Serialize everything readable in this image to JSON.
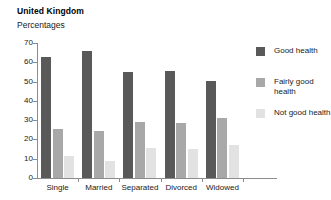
{
  "chart_data": {
    "type": "bar",
    "title": "United Kingdom",
    "subtitle": "Percentages",
    "xlabel": "",
    "ylabel": "",
    "ylim": [
      0,
      70
    ],
    "yticks": [
      0,
      10,
      20,
      30,
      40,
      50,
      60,
      70
    ],
    "grid": false,
    "legend_position": "right",
    "categories": [
      "Single",
      "Married",
      "Separated",
      "Divorced",
      "Widowed"
    ],
    "series": [
      {
        "name": "Good health",
        "color": "#595959",
        "values": [
          63,
          66,
          55,
          55.5,
          50.5
        ]
      },
      {
        "name": "Fairly good health",
        "color": "#a8a8a8",
        "values": [
          25.5,
          24.5,
          29,
          28.5,
          31
        ]
      },
      {
        "name": "Not good health",
        "color": "#e2e2e2",
        "values": [
          11.5,
          9,
          15.5,
          15,
          17
        ]
      }
    ]
  },
  "legend": {
    "items": [
      {
        "label": "Good health"
      },
      {
        "label": "Fairly good health"
      },
      {
        "label": "Not good health"
      }
    ]
  }
}
